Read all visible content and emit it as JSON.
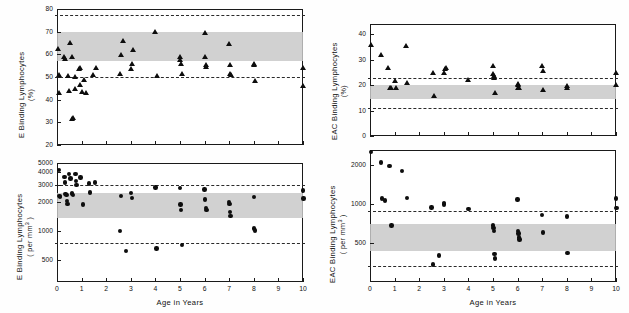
{
  "figure": {
    "background": "#ffffff",
    "marker_color": "#0d0d0d",
    "band_color": "#c9c9c9",
    "dashed_color": "#2a2a2a"
  },
  "chart_data": [
    {
      "id": "top-left",
      "type": "scatter",
      "title": "",
      "xlabel": "",
      "ylabel": "E Binding Lymphocytes (%)",
      "ylabel_line1": "E  Binding  Lymphocytes",
      "ylabel_line2": "(%)",
      "marker": "triangle",
      "xlim": [
        0,
        10
      ],
      "ylim": [
        20,
        80
      ],
      "xticks": [
        0,
        1,
        2,
        3,
        4,
        5,
        6,
        7,
        8,
        9,
        10
      ],
      "xticklabels": [
        "",
        "",
        "",
        "",
        "",
        "",
        "",
        "",
        "",
        "",
        ""
      ],
      "yticks": [
        20,
        30,
        40,
        50,
        60,
        70,
        80
      ],
      "yticklabels": [
        "20",
        "30",
        "40",
        "50",
        "60",
        "70",
        "80"
      ],
      "grid": false,
      "legend": "none",
      "reference_band": {
        "low": 57.0,
        "high": 70.0
      },
      "reference_lines": [
        50.0,
        77.5
      ],
      "points": [
        {
          "x": 0.05,
          "y": 62.5
        },
        {
          "x": 0.08,
          "y": 51.0
        },
        {
          "x": 0.1,
          "y": 43.0
        },
        {
          "x": 0.3,
          "y": 59.0
        },
        {
          "x": 0.32,
          "y": 58.0
        },
        {
          "x": 0.45,
          "y": 50.5
        },
        {
          "x": 0.5,
          "y": 44.0
        },
        {
          "x": 0.55,
          "y": 65.0
        },
        {
          "x": 0.6,
          "y": 59.0
        },
        {
          "x": 0.62,
          "y": 31.5
        },
        {
          "x": 0.64,
          "y": 32.0
        },
        {
          "x": 0.72,
          "y": 50.0
        },
        {
          "x": 0.75,
          "y": 45.0
        },
        {
          "x": 0.9,
          "y": 53.5
        },
        {
          "x": 0.92,
          "y": 54.0
        },
        {
          "x": 0.95,
          "y": 46.5
        },
        {
          "x": 1.0,
          "y": 43.5
        },
        {
          "x": 1.1,
          "y": 49.0
        },
        {
          "x": 1.2,
          "y": 43.0
        },
        {
          "x": 1.45,
          "y": 51.0
        },
        {
          "x": 1.6,
          "y": 54.0
        },
        {
          "x": 2.55,
          "y": 51.5
        },
        {
          "x": 2.6,
          "y": 60.0
        },
        {
          "x": 2.7,
          "y": 66.0
        },
        {
          "x": 3.0,
          "y": 53.5
        },
        {
          "x": 3.05,
          "y": 56.0
        },
        {
          "x": 3.1,
          "y": 62.0
        },
        {
          "x": 4.0,
          "y": 70.0
        },
        {
          "x": 4.05,
          "y": 50.5
        },
        {
          "x": 5.0,
          "y": 59.0
        },
        {
          "x": 5.02,
          "y": 57.5
        },
        {
          "x": 5.05,
          "y": 56.0
        },
        {
          "x": 5.08,
          "y": 51.5
        },
        {
          "x": 6.0,
          "y": 69.5
        },
        {
          "x": 6.02,
          "y": 59.0
        },
        {
          "x": 6.05,
          "y": 55.5
        },
        {
          "x": 6.08,
          "y": 54.5
        },
        {
          "x": 7.0,
          "y": 64.5
        },
        {
          "x": 7.02,
          "y": 55.5
        },
        {
          "x": 7.04,
          "y": 51.5
        },
        {
          "x": 7.06,
          "y": 51.0
        },
        {
          "x": 8.0,
          "y": 56.0
        },
        {
          "x": 8.02,
          "y": 55.5
        },
        {
          "x": 8.05,
          "y": 48.5
        },
        {
          "x": 10.0,
          "y": 54.0
        },
        {
          "x": 10.02,
          "y": 46.0
        }
      ]
    },
    {
      "id": "bottom-left",
      "type": "scatter",
      "title": "",
      "xlabel": "Age  in  Years",
      "ylabel": "E Binding Lymphocytes (per mm3)",
      "ylabel_line1": "E  Binding  Lymphocytes",
      "ylabel_line2": "( per mm3 )",
      "marker": "circle",
      "xlim": [
        0,
        10
      ],
      "ylim": [
        300,
        5000
      ],
      "xticks": [
        0,
        1,
        2,
        3,
        4,
        5,
        6,
        7,
        8,
        9,
        10
      ],
      "xticklabels": [
        "0",
        "1",
        "2",
        "3",
        "4",
        "5",
        "6",
        "7",
        "8",
        "9",
        "10"
      ],
      "yticks": [
        500,
        1000,
        2000,
        3000,
        4000,
        5000
      ],
      "yticklabels": [
        "500",
        "1000",
        "2000",
        "3000",
        "4000",
        "5000"
      ],
      "grid": false,
      "legend": "none",
      "reference_band": {
        "low": 1350,
        "high": 2450
      },
      "reference_lines": [
        750,
        3000
      ],
      "points": [
        {
          "x": 0.08,
          "y": 4250
        },
        {
          "x": 0.1,
          "y": 2300
        },
        {
          "x": 0.12,
          "y": 2250
        },
        {
          "x": 0.3,
          "y": 3600
        },
        {
          "x": 0.32,
          "y": 3150
        },
        {
          "x": 0.35,
          "y": 2400
        },
        {
          "x": 0.38,
          "y": 2350
        },
        {
          "x": 0.4,
          "y": 2050
        },
        {
          "x": 0.42,
          "y": 1900
        },
        {
          "x": 0.5,
          "y": 3850
        },
        {
          "x": 0.55,
          "y": 3450
        },
        {
          "x": 0.6,
          "y": 2450
        },
        {
          "x": 0.62,
          "y": 2400
        },
        {
          "x": 0.65,
          "y": 2350
        },
        {
          "x": 0.75,
          "y": 3850
        },
        {
          "x": 0.78,
          "y": 3250
        },
        {
          "x": 0.8,
          "y": 2990
        },
        {
          "x": 0.95,
          "y": 3550
        },
        {
          "x": 1.05,
          "y": 1880
        },
        {
          "x": 1.3,
          "y": 3080
        },
        {
          "x": 1.35,
          "y": 2500
        },
        {
          "x": 1.55,
          "y": 3150
        },
        {
          "x": 2.55,
          "y": 1000
        },
        {
          "x": 2.6,
          "y": 2300
        },
        {
          "x": 2.8,
          "y": 620
        },
        {
          "x": 3.0,
          "y": 2450
        },
        {
          "x": 3.05,
          "y": 2180
        },
        {
          "x": 4.0,
          "y": 2800
        },
        {
          "x": 4.05,
          "y": 660
        },
        {
          "x": 5.0,
          "y": 2760
        },
        {
          "x": 5.02,
          "y": 1880
        },
        {
          "x": 5.05,
          "y": 1650
        },
        {
          "x": 5.08,
          "y": 720
        },
        {
          "x": 6.0,
          "y": 2680
        },
        {
          "x": 6.02,
          "y": 2100
        },
        {
          "x": 6.05,
          "y": 1720
        },
        {
          "x": 6.07,
          "y": 1650
        },
        {
          "x": 7.0,
          "y": 1980
        },
        {
          "x": 7.02,
          "y": 1900
        },
        {
          "x": 7.04,
          "y": 1560
        },
        {
          "x": 7.06,
          "y": 1430
        },
        {
          "x": 8.0,
          "y": 2230
        },
        {
          "x": 8.02,
          "y": 1060
        },
        {
          "x": 8.04,
          "y": 1010
        },
        {
          "x": 10.0,
          "y": 2600
        },
        {
          "x": 10.02,
          "y": 2150
        }
      ]
    },
    {
      "id": "top-right",
      "type": "scatter",
      "title": "",
      "xlabel": "",
      "ylabel": "EAC Binding Lymphocytes (%)",
      "ylabel_line1": "EAC  Binding  Lymphocytes",
      "ylabel_line2": "(%)",
      "marker": "triangle",
      "xlim": [
        0,
        10
      ],
      "ylim": [
        0,
        44
      ],
      "xticks": [
        0,
        1,
        2,
        3,
        4,
        5,
        6,
        7,
        8,
        9,
        10
      ],
      "xticklabels": [
        "",
        "",
        "",
        "",
        "",
        "",
        "",
        "",
        "",
        "",
        ""
      ],
      "yticks": [
        0,
        10,
        20,
        30,
        40
      ],
      "yticklabels": [
        "0",
        "10",
        "20",
        "30",
        "40"
      ],
      "grid": false,
      "legend": "none",
      "reference_band": {
        "low": 14.5,
        "high": 20.0
      },
      "reference_lines": [
        11.0,
        22.8
      ],
      "points": [
        {
          "x": 0.05,
          "y": 36.0
        },
        {
          "x": 0.45,
          "y": 32.0
        },
        {
          "x": 0.75,
          "y": 27.0
        },
        {
          "x": 0.8,
          "y": 19.0
        },
        {
          "x": 0.85,
          "y": 18.8
        },
        {
          "x": 1.0,
          "y": 21.8
        },
        {
          "x": 1.05,
          "y": 19.0
        },
        {
          "x": 1.45,
          "y": 35.5
        },
        {
          "x": 1.5,
          "y": 20.8
        },
        {
          "x": 2.55,
          "y": 25.0
        },
        {
          "x": 2.6,
          "y": 16.0
        },
        {
          "x": 3.0,
          "y": 25.0
        },
        {
          "x": 3.05,
          "y": 26.5
        },
        {
          "x": 3.08,
          "y": 26.8
        },
        {
          "x": 4.0,
          "y": 22.0
        },
        {
          "x": 5.0,
          "y": 27.5
        },
        {
          "x": 5.02,
          "y": 24.5
        },
        {
          "x": 5.04,
          "y": 23.5
        },
        {
          "x": 5.06,
          "y": 23.0
        },
        {
          "x": 5.08,
          "y": 17.0
        },
        {
          "x": 6.0,
          "y": 20.5
        },
        {
          "x": 6.02,
          "y": 20.0
        },
        {
          "x": 6.04,
          "y": 19.0
        },
        {
          "x": 6.06,
          "y": 18.8
        },
        {
          "x": 7.0,
          "y": 27.5
        },
        {
          "x": 7.02,
          "y": 25.5
        },
        {
          "x": 7.05,
          "y": 18.0
        },
        {
          "x": 8.0,
          "y": 19.8
        },
        {
          "x": 8.03,
          "y": 19.0
        },
        {
          "x": 10.0,
          "y": 24.8
        },
        {
          "x": 10.02,
          "y": 20.0
        }
      ]
    },
    {
      "id": "bottom-right",
      "type": "scatter",
      "title": "",
      "xlabel": "Age  in  Years",
      "ylabel": "EAC Binding Lymphocytes (per mm3)",
      "ylabel_line1": "EAC  Binding  Lymphocytes",
      "ylabel_line2": "( per mm3 )",
      "marker": "circle",
      "xlim": [
        0,
        10
      ],
      "ylim": [
        250,
        2600
      ],
      "xticks": [
        0,
        1,
        2,
        3,
        4,
        5,
        6,
        7,
        8,
        9,
        10
      ],
      "xticklabels": [
        "0",
        "1",
        "2",
        "3",
        "4",
        "5",
        "6",
        "7",
        "8",
        "9",
        "10"
      ],
      "yticks": [
        500,
        1000,
        2000
      ],
      "yticklabels": [
        "500",
        "1000",
        "2000"
      ],
      "grid": false,
      "legend": "none",
      "reference_band": {
        "low": 430,
        "high": 700
      },
      "reference_lines": [
        330,
        880
      ],
      "points": [
        {
          "x": 0.05,
          "y": 2500
        },
        {
          "x": 0.45,
          "y": 2080
        },
        {
          "x": 0.5,
          "y": 1100
        },
        {
          "x": 0.62,
          "y": 1060
        },
        {
          "x": 0.8,
          "y": 1950
        },
        {
          "x": 0.88,
          "y": 680
        },
        {
          "x": 1.3,
          "y": 1800
        },
        {
          "x": 1.5,
          "y": 1110
        },
        {
          "x": 2.5,
          "y": 940
        },
        {
          "x": 2.55,
          "y": 340
        },
        {
          "x": 2.8,
          "y": 400
        },
        {
          "x": 3.0,
          "y": 1010
        },
        {
          "x": 3.02,
          "y": 990
        },
        {
          "x": 4.0,
          "y": 910
        },
        {
          "x": 5.0,
          "y": 680
        },
        {
          "x": 5.02,
          "y": 650
        },
        {
          "x": 5.04,
          "y": 620
        },
        {
          "x": 5.06,
          "y": 410
        },
        {
          "x": 5.08,
          "y": 380
        },
        {
          "x": 6.0,
          "y": 1080
        },
        {
          "x": 6.02,
          "y": 620
        },
        {
          "x": 6.04,
          "y": 590
        },
        {
          "x": 6.06,
          "y": 550
        },
        {
          "x": 6.08,
          "y": 530
        },
        {
          "x": 7.0,
          "y": 820
        },
        {
          "x": 7.03,
          "y": 600
        },
        {
          "x": 8.0,
          "y": 800
        },
        {
          "x": 8.03,
          "y": 420
        },
        {
          "x": 10.0,
          "y": 1100
        },
        {
          "x": 10.02,
          "y": 930
        }
      ]
    }
  ]
}
